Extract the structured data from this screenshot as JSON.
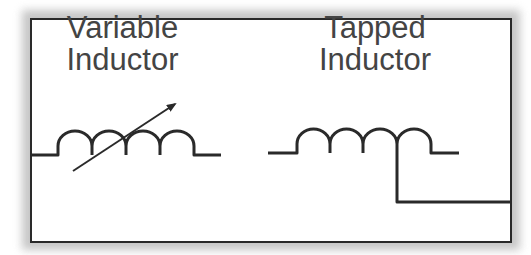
{
  "diagram": {
    "type": "circuit-symbols",
    "symbols": [
      {
        "id": "variable-inductor",
        "label_line1": "Variable",
        "label_line2": "Inductor",
        "coil_turns": 4,
        "has_arrow": true
      },
      {
        "id": "tapped-inductor",
        "label_line1": "Tapped",
        "label_line2": "Inductor",
        "coil_turns": 4,
        "has_tap": true
      }
    ],
    "colors": {
      "stroke": "#2a2a2a",
      "text": "#444444",
      "background": "#ffffff",
      "shadow": "#bdbdbd"
    }
  }
}
